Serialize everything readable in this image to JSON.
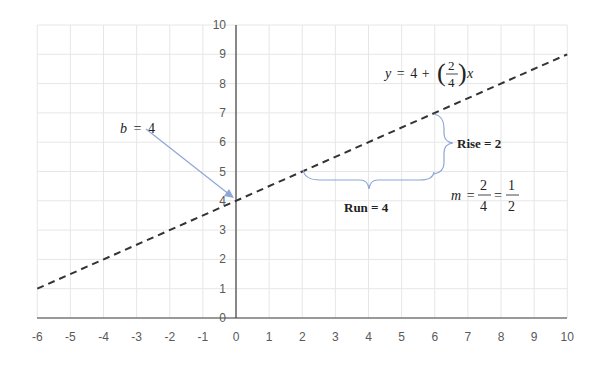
{
  "chart_data": {
    "type": "line",
    "title": "",
    "xlabel": "",
    "ylabel": "",
    "xlim": [
      -6,
      10
    ],
    "ylim": [
      0,
      10
    ],
    "grid": true,
    "x_ticks": [
      "-6",
      "-5",
      "-4",
      "-3",
      "-2",
      "-1",
      "0",
      "1",
      "2",
      "3",
      "4",
      "5",
      "6",
      "7",
      "8",
      "9",
      "10"
    ],
    "y_ticks": [
      "0",
      "1",
      "2",
      "3",
      "4",
      "5",
      "6",
      "7",
      "8",
      "9",
      "10"
    ],
    "series": [
      {
        "name": "y = 4 + (2/4)x",
        "style": "dashed",
        "color": "#333333",
        "x": [
          -6,
          -4,
          -2,
          0,
          2,
          4,
          6,
          8,
          10
        ],
        "y": [
          1,
          2,
          3,
          4,
          5,
          6,
          7,
          8,
          9
        ]
      }
    ],
    "annotations": {
      "equation": {
        "lhs": "y",
        "const": "4",
        "plus": "+",
        "num": "2",
        "den": "4",
        "var": "x"
      },
      "intercept_label": {
        "var": "b",
        "eq": "=",
        "value": "4",
        "points_to": [
          0,
          4
        ]
      },
      "rise_label": "Rise = 2",
      "run_label": "Run = 4",
      "slope": {
        "var": "m",
        "eq": "=",
        "num1": "2",
        "den1": "4",
        "num2": "1",
        "den2": "2"
      }
    },
    "colors": {
      "grid": "#e6e6e6",
      "axis": "#404040",
      "annotation": "#8ea6d8"
    }
  }
}
